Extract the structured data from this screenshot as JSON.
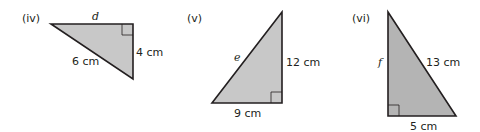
{
  "figure": {
    "fill_color": "#c8c8c8",
    "stroke_color": "#231f20",
    "triangles": [
      {
        "label": "(iv)",
        "unknown": "d",
        "unknown_side": "top leg",
        "sides": {
          "hypotenuse": "6 cm",
          "vertical_leg": "4 cm"
        },
        "right_angle": "top-right"
      },
      {
        "label": "(v)",
        "unknown": "e",
        "unknown_side": "hypotenuse",
        "sides": {
          "vertical_leg": "12 cm",
          "bottom_leg": "9 cm"
        },
        "right_angle": "bottom-right"
      },
      {
        "label": "(vi)",
        "unknown": "f",
        "unknown_side": "vertical leg",
        "sides": {
          "hypotenuse": "13 cm",
          "bottom_leg": "5 cm"
        },
        "right_angle": "bottom-left"
      }
    ]
  }
}
